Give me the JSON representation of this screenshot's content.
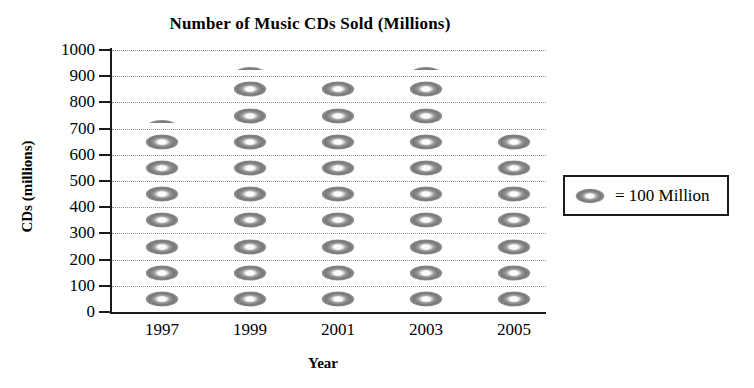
{
  "chart_data": {
    "type": "bar",
    "variant": "pictograph",
    "title": "Number of Music CDs Sold (Millions)",
    "xlabel": "Year",
    "ylabel": "CDs (millions)",
    "categories": [
      "1997",
      "1999",
      "2001",
      "2003",
      "2005"
    ],
    "values": [
      750,
      950,
      850,
      950,
      650
    ],
    "icon_unit_value": 100,
    "icon_counts_full": [
      7,
      9,
      9,
      9,
      7
    ],
    "icon_counts_half": [
      1,
      1,
      0,
      1,
      0
    ],
    "ylim": [
      0,
      1000
    ],
    "ytick_labels": [
      "0",
      "100",
      "200",
      "300",
      "400",
      "500",
      "600",
      "700",
      "800",
      "900",
      "1000"
    ],
    "ytick_values": [
      0,
      100,
      200,
      300,
      400,
      500,
      600,
      700,
      800,
      900,
      1000
    ],
    "grid": true,
    "grid_style": "dotted",
    "legend": {
      "position": "right",
      "icon_name": "cd-disc-icon",
      "text": "=  100 Million"
    },
    "icon_color": "#8a8a8a",
    "axis_color": "#1a1a1a",
    "grid_color": "#8c8c8c",
    "background": "#ffffff"
  }
}
